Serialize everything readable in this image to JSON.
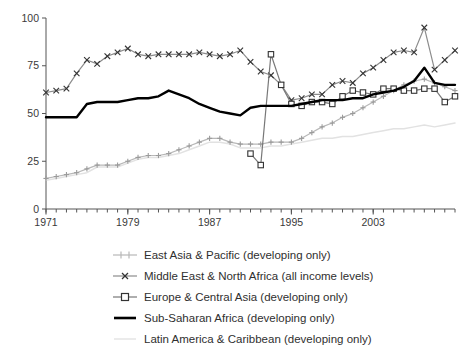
{
  "chart_data": {
    "type": "line",
    "title": "",
    "subtitle": "",
    "xlabel": "",
    "ylabel": "",
    "xlim": [
      1971,
      2011
    ],
    "ylim": [
      0,
      100
    ],
    "yticks": [
      0,
      25,
      50,
      75,
      100
    ],
    "ytick_labels": [
      "0",
      "25",
      "50",
      "75",
      "100"
    ],
    "xticks": [
      1971,
      1979,
      1987,
      1995,
      2003
    ],
    "xtick_labels": [
      "1971",
      "1979",
      "1987",
      "1995",
      "2003"
    ],
    "x_minor_tick_step": 1,
    "grid": false,
    "legend_position": "below-center",
    "x": [
      1971,
      1972,
      1973,
      1974,
      1975,
      1976,
      1977,
      1978,
      1979,
      1980,
      1981,
      1982,
      1983,
      1984,
      1985,
      1986,
      1987,
      1988,
      1989,
      1990,
      1991,
      1992,
      1993,
      1994,
      1995,
      1996,
      1997,
      1998,
      1999,
      2000,
      2001,
      2002,
      2003,
      2004,
      2005,
      2006,
      2007,
      2008,
      2009,
      2010,
      2011
    ],
    "series": [
      {
        "name": "East Asia & Pacific (developing only)",
        "marker": "plus",
        "color": "#b8b8b8",
        "values": [
          16,
          17,
          18,
          19,
          21,
          23,
          23,
          23,
          25,
          27,
          28,
          28,
          29,
          31,
          33,
          35,
          37,
          37,
          35,
          34,
          34,
          34,
          35,
          35,
          35,
          37,
          40,
          43,
          45,
          48,
          50,
          53,
          56,
          59,
          62,
          65,
          67,
          68,
          66,
          64,
          62
        ]
      },
      {
        "name": "Middle East & North Africa (all income levels)",
        "marker": "cross",
        "color": "#8c8c8c",
        "values": [
          61,
          62,
          63,
          71,
          78,
          76,
          80,
          82,
          84,
          81,
          80,
          81,
          81,
          81,
          81,
          82,
          81,
          80,
          81,
          83,
          77,
          72,
          70,
          65,
          57,
          58,
          60,
          60,
          65,
          67,
          66,
          71,
          74,
          78,
          82,
          83,
          82,
          95,
          73,
          78,
          83
        ]
      },
      {
        "name": "Europe & Central Asia (developing only)",
        "marker": "square",
        "color": "#787878",
        "values": [
          null,
          null,
          null,
          null,
          null,
          null,
          null,
          null,
          null,
          null,
          null,
          null,
          null,
          null,
          null,
          null,
          null,
          null,
          null,
          null,
          29,
          23,
          81,
          65,
          55,
          54,
          56,
          56,
          55,
          59,
          62,
          61,
          60,
          63,
          63,
          62,
          62,
          63,
          63,
          56,
          59
        ]
      },
      {
        "name": "Sub-Saharan Africa (developing only)",
        "marker": "none",
        "color": "#000000",
        "values": [
          48,
          48,
          48,
          48,
          55,
          56,
          56,
          56,
          57,
          58,
          58,
          59,
          62,
          60,
          58,
          55,
          53,
          51,
          50,
          49,
          53,
          54,
          54,
          54,
          54,
          55,
          56,
          57,
          57,
          57,
          58,
          58,
          60,
          61,
          62,
          64,
          67,
          74,
          66,
          65,
          65
        ]
      },
      {
        "name": "Latin America & Caribbean (developing only)",
        "marker": "none",
        "color": "#e2e2e2",
        "values": [
          15,
          16,
          17,
          18,
          19,
          22,
          22,
          22,
          24,
          26,
          27,
          27,
          28,
          29,
          31,
          33,
          35,
          35,
          34,
          32,
          32,
          32,
          33,
          33,
          34,
          35,
          36,
          37,
          37,
          38,
          38,
          39,
          40,
          41,
          42,
          42,
          43,
          44,
          43,
          44,
          45
        ]
      }
    ]
  },
  "legend": {
    "items": [
      {
        "label": "East Asia & Pacific (developing only)",
        "marker": "plus-marker",
        "color": "#b8b8b8"
      },
      {
        "label": "Middle East & North Africa (all income levels)",
        "marker": "cross-marker",
        "color": "#8c8c8c"
      },
      {
        "label": "Europe & Central Asia (developing only)",
        "marker": "square-marker",
        "color": "#787878"
      },
      {
        "label": "Sub-Saharan Africa (developing only)",
        "marker": "solid-line-marker",
        "color": "#000000"
      },
      {
        "label": "Latin America & Caribbean (developing only)",
        "marker": "faint-line-marker",
        "color": "#e2e2e2"
      }
    ]
  }
}
